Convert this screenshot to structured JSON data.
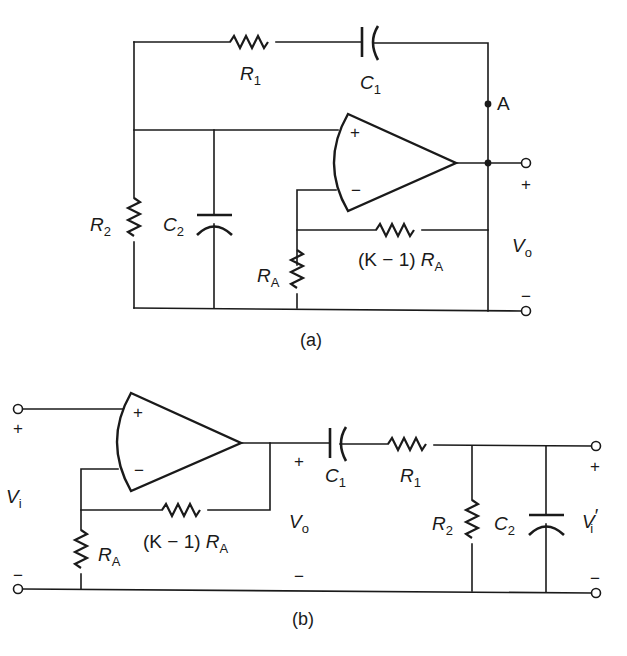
{
  "figure": {
    "panels": [
      {
        "id": "a",
        "caption": "(a)",
        "components": {
          "R1": {
            "main": "R",
            "sub": "1"
          },
          "C1": {
            "main": "C",
            "sub": "1"
          },
          "R2": {
            "main": "R",
            "sub": "2"
          },
          "C2": {
            "main": "C",
            "sub": "2"
          },
          "RA": {
            "main": "R",
            "sub": "A"
          },
          "feedback": {
            "prefix": "(K − 1) ",
            "main": "R",
            "sub": "A"
          }
        },
        "node_label": "A",
        "opamp": {
          "plus": "+",
          "minus": "−"
        },
        "output": {
          "main": "V",
          "sub": "o",
          "plus": "+",
          "minus": "−"
        }
      },
      {
        "id": "b",
        "caption": "(b)",
        "components": {
          "C1": {
            "main": "C",
            "sub": "1"
          },
          "R1": {
            "main": "R",
            "sub": "1"
          },
          "R2": {
            "main": "R",
            "sub": "2"
          },
          "C2": {
            "main": "C",
            "sub": "2"
          },
          "RA": {
            "main": "R",
            "sub": "A"
          },
          "feedback": {
            "prefix": "(K − 1) ",
            "main": "R",
            "sub": "A"
          }
        },
        "opamp": {
          "plus": "+",
          "minus": "−"
        },
        "input": {
          "main": "V",
          "sub": "i",
          "plus": "+",
          "minus": "−"
        },
        "mid": {
          "main": "V",
          "sub": "o",
          "plus": "+",
          "minus": "−"
        },
        "output": {
          "main": "V",
          "sub": "i",
          "prime": "′",
          "plus": "+",
          "minus": "−"
        }
      }
    ]
  }
}
